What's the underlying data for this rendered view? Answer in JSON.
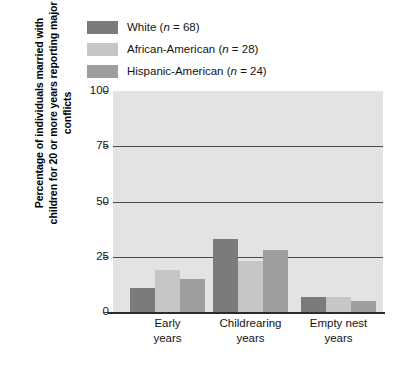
{
  "legend": {
    "items": [
      {
        "label": "White (n = 68)",
        "name": "White",
        "n": 68,
        "color": "#7b7b7b"
      },
      {
        "label": "African-American (n = 28)",
        "name": "African-American",
        "n": 28,
        "color": "#c6c6c6"
      },
      {
        "label": "Hispanic-American (n = 24)",
        "name": "Hispanic-American",
        "n": 24,
        "color": "#9e9e9e"
      }
    ]
  },
  "axes": {
    "y_title": "Percentage of individuals married with children for 20 or more years reporting major conflicts",
    "y_ticks": [
      "100",
      "75",
      "50",
      "25",
      "0"
    ],
    "x_labels": [
      {
        "line1": "Early",
        "line2": "years"
      },
      {
        "line1": "Childrearing",
        "line2": "years"
      },
      {
        "line1": "Empty nest",
        "line2": "years"
      }
    ]
  },
  "chart_data": {
    "type": "bar",
    "title": "",
    "xlabel": "",
    "ylabel": "Percentage of individuals married with children for 20 or more years reporting major conflicts",
    "categories": [
      "Early years",
      "Childrearing years",
      "Empty nest years"
    ],
    "series": [
      {
        "name": "White (n = 68)",
        "color": "#7b7b7b",
        "values": [
          11,
          33,
          7
        ]
      },
      {
        "name": "African-American (n = 28)",
        "color": "#c6c6c6",
        "values": [
          19,
          23,
          7
        ]
      },
      {
        "name": "Hispanic-American (n = 24)",
        "color": "#9e9e9e",
        "values": [
          15,
          28,
          5
        ]
      }
    ],
    "ylim": [
      0,
      100
    ],
    "yticks": [
      0,
      25,
      50,
      75,
      100
    ],
    "grid": true,
    "grid_axis": "y",
    "legend_position": "top-left",
    "plot_background": "#e3e3e3"
  }
}
